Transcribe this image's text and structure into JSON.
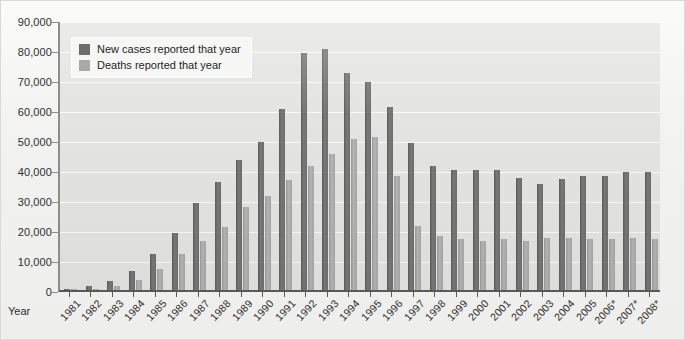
{
  "chart_data": {
    "type": "bar",
    "title": "",
    "subtitle": "",
    "xlabel": "Year",
    "ylabel": "",
    "ylim": [
      0,
      90000
    ],
    "ytick_labels": [
      "0",
      "10,000",
      "20,000",
      "30,000",
      "40,000",
      "50,000",
      "60,000",
      "70,000",
      "80,000",
      "90,000"
    ],
    "ytick_values": [
      0,
      10000,
      20000,
      30000,
      40000,
      50000,
      60000,
      70000,
      80000,
      90000
    ],
    "grid": true,
    "legend_position": "top-left",
    "categories": [
      "1981",
      "1982",
      "1983",
      "1984",
      "1985",
      "1986",
      "1987",
      "1988",
      "1989",
      "1990",
      "1991",
      "1992",
      "1993",
      "1994",
      "1995",
      "1996",
      "1997",
      "1998",
      "1999",
      "2000",
      "2001",
      "2002",
      "2003",
      "2004",
      "2005",
      "2006*",
      "2007*",
      "2008*"
    ],
    "series": [
      {
        "name": "New cases reported that year",
        "color": "#6d6d6d",
        "values": [
          300,
          1200,
          3100,
          6400,
          12000,
          19000,
          29000,
          36000,
          43500,
          49500,
          60500,
          79000,
          80500,
          72500,
          69500,
          61000,
          49000,
          41500,
          40000,
          40000,
          40000,
          37500,
          35500,
          37000,
          38000,
          38000,
          39500,
          39500
        ]
      },
      {
        "name": "Deaths reported that year",
        "color": "#a9a9a9",
        "values": [
          130,
          450,
          1500,
          3500,
          6900,
          12000,
          16200,
          21000,
          27700,
          31500,
          36600,
          41500,
          45500,
          50500,
          51000,
          38000,
          21500,
          18000,
          17000,
          16500,
          17000,
          16500,
          17500,
          17500,
          17000,
          17000,
          17500,
          17000
        ]
      }
    ]
  },
  "legend": {
    "items": [
      {
        "label": "New cases reported that year"
      },
      {
        "label": "Deaths reported that year"
      }
    ]
  },
  "axes": {
    "x_title": "Year"
  }
}
